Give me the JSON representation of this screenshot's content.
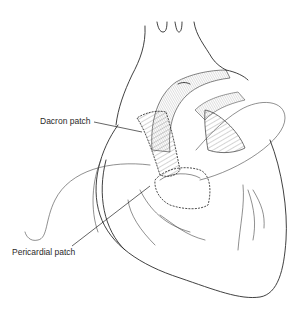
{
  "figure": {
    "labels": [
      {
        "text": "Dacron patch"
      },
      {
        "text": "Pericardial patch"
      }
    ]
  }
}
